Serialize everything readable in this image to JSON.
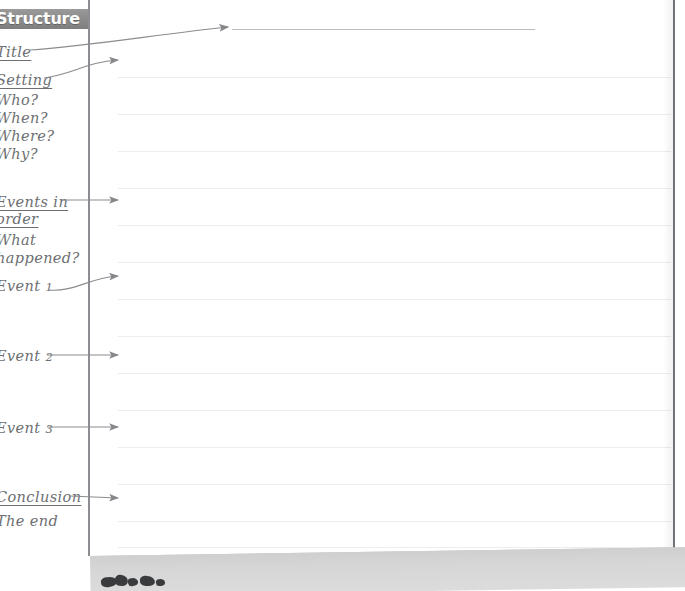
{
  "document": {
    "type": "handwritten-annotated-worksheet-scan",
    "header_label": "Structure",
    "title_line_present": true
  },
  "colors": {
    "header_band": "#8d8d8d",
    "header_text": "#ffffff",
    "ink": "#6d6f72",
    "margin_rule": "#8b8d90",
    "ruled_line": "#eceded",
    "page_edge": "#6f7276",
    "under_sheet": "#d6d6d6"
  },
  "margin_notes": [
    {
      "id": "title",
      "text": "Title",
      "underlined": true,
      "top": 44,
      "has_arrow": true,
      "arrow": "long-up-right"
    },
    {
      "id": "setting",
      "text": "Setting",
      "underlined": true,
      "top": 72,
      "has_arrow": true,
      "arrow": "curved-right"
    },
    {
      "id": "who",
      "text": "Who?",
      "underlined": false,
      "top": 92,
      "has_arrow": false,
      "arrow": ""
    },
    {
      "id": "when",
      "text": "When?",
      "underlined": false,
      "top": 110,
      "has_arrow": false,
      "arrow": ""
    },
    {
      "id": "where",
      "text": "Where?",
      "underlined": false,
      "top": 128,
      "has_arrow": false,
      "arrow": ""
    },
    {
      "id": "why",
      "text": "Why?",
      "underlined": false,
      "top": 146,
      "has_arrow": false,
      "arrow": ""
    },
    {
      "id": "events-in",
      "text": "Events in",
      "underlined": true,
      "top": 194,
      "has_arrow": true,
      "arrow": "straight-right"
    },
    {
      "id": "order",
      "text": "order",
      "underlined": true,
      "top": 211,
      "has_arrow": false,
      "arrow": ""
    },
    {
      "id": "what",
      "text": "What",
      "underlined": false,
      "top": 232,
      "has_arrow": false,
      "arrow": ""
    },
    {
      "id": "happened",
      "text": "happened?",
      "underlined": false,
      "top": 250,
      "has_arrow": false,
      "arrow": ""
    },
    {
      "id": "event-1",
      "text": "Event 1",
      "underlined": false,
      "top": 278,
      "has_arrow": true,
      "arrow": "curved-right"
    },
    {
      "id": "event-2",
      "text": "Event 2",
      "underlined": false,
      "top": 348,
      "has_arrow": true,
      "arrow": "straight-right"
    },
    {
      "id": "event-3",
      "text": "Event 3",
      "underlined": false,
      "top": 420,
      "has_arrow": true,
      "arrow": "straight-right"
    },
    {
      "id": "conclusion",
      "text": "Conclusion",
      "underlined": true,
      "top": 489,
      "has_arrow": true,
      "arrow": "straight-right"
    },
    {
      "id": "the-end",
      "text": "The end",
      "underlined": false,
      "top": 513,
      "has_arrow": false,
      "arrow": ""
    }
  ],
  "ruled_lines": {
    "count": 15,
    "left": 118,
    "right": 671,
    "tops": [
      77,
      114,
      151,
      188,
      225,
      262,
      299,
      336,
      373,
      410,
      447,
      484,
      521,
      547,
      560
    ]
  },
  "title_writing_line": {
    "left": 232,
    "right": 535,
    "top": 29
  },
  "page_edge": {
    "x": 673,
    "top": 0,
    "height": 575
  },
  "margin_rule": {
    "x": 88,
    "top": 0,
    "height": 575
  },
  "under_sheet": {
    "label": "lower sheet edge",
    "top": 556
  }
}
